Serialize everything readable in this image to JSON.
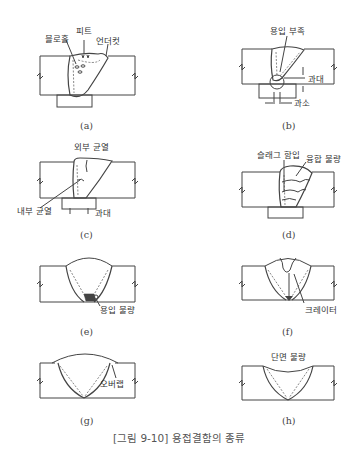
{
  "figure": {
    "caption": "[그림 9-10] 용접결함의 종류",
    "panels": [
      {
        "id": "a",
        "label": "(a)",
        "annotations": [
          "블로홀",
          "피트",
          "언더컷"
        ]
      },
      {
        "id": "b",
        "label": "(b)",
        "annotations": [
          "용입 부족",
          "과대",
          "과소"
        ]
      },
      {
        "id": "c",
        "label": "(c)",
        "annotations": [
          "외부 균열",
          "내부 균열",
          "과대"
        ]
      },
      {
        "id": "d",
        "label": "(d)",
        "annotations": [
          "슬래그 함입",
          "융합 불량"
        ]
      },
      {
        "id": "e",
        "label": "(e)",
        "annotations": [
          "용입 불량"
        ]
      },
      {
        "id": "f",
        "label": "(f)",
        "annotations": [
          "크레이터"
        ]
      },
      {
        "id": "g",
        "label": "(g)",
        "annotations": [
          "오버랩"
        ]
      },
      {
        "id": "h",
        "label": "(h)",
        "annotations": [
          "단면 불량"
        ]
      }
    ]
  }
}
